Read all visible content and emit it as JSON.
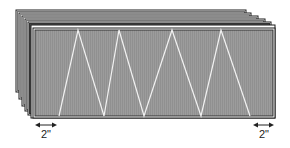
{
  "diagram": {
    "colors": {
      "panel_fill": "#9a9a9a",
      "panel_stripe": "#8e8e8e",
      "outline": "#1a1a1a",
      "zigzag": "#f2f2f2",
      "dimension": "#222222"
    },
    "stack_layers": 6,
    "front_panel": {
      "x": 33,
      "y": 28,
      "w": 242,
      "h": 90
    },
    "zigzag_points": [
      [
        59,
        116
      ],
      [
        78,
        30
      ],
      [
        104,
        116
      ],
      [
        119,
        30
      ],
      [
        144,
        116
      ],
      [
        172,
        30
      ],
      [
        201,
        116
      ],
      [
        221,
        30
      ],
      [
        250,
        116
      ]
    ],
    "dimensions": [
      {
        "label": "2\"",
        "x1": 35,
        "x2": 57,
        "y": 125,
        "text_x": 46,
        "text_y": 138
      },
      {
        "label": "2\"",
        "x1": 253,
        "x2": 274,
        "y": 125,
        "text_x": 264,
        "text_y": 138
      }
    ]
  }
}
